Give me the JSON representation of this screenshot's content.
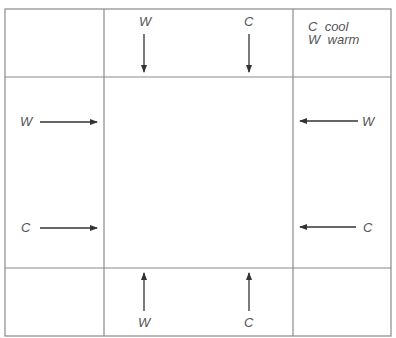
{
  "diagram": {
    "grid": {
      "outer": {
        "x1": 5,
        "y1": 9,
        "x2": 391,
        "y2": 336
      },
      "inner": {
        "x1": 104,
        "y1": 77,
        "x2": 293,
        "y2": 268
      },
      "line_color": "#8a8a8a"
    },
    "legend": {
      "entries": [
        {
          "symbol": "C",
          "meaning": "cool"
        },
        {
          "symbol": "W",
          "meaning": "warm"
        }
      ]
    },
    "arrows": [
      {
        "id": "top-left",
        "label": "W",
        "direction": "down",
        "label_x": 139,
        "label_y": 15
      },
      {
        "id": "top-right",
        "label": "C",
        "direction": "down",
        "label_x": 244,
        "label_y": 15
      },
      {
        "id": "left-top",
        "label": "W",
        "direction": "right",
        "label_x": 20,
        "label_y": 115
      },
      {
        "id": "left-bottom",
        "label": "C",
        "direction": "right",
        "label_x": 21,
        "label_y": 221
      },
      {
        "id": "right-top",
        "label": "W",
        "direction": "left",
        "label_x": 362,
        "label_y": 115
      },
      {
        "id": "right-bottom",
        "label": "C",
        "direction": "left",
        "label_x": 363,
        "label_y": 221
      },
      {
        "id": "bottom-left",
        "label": "W",
        "direction": "up",
        "label_x": 138,
        "label_y": 316
      },
      {
        "id": "bottom-right",
        "label": "C",
        "direction": "up",
        "label_x": 244,
        "label_y": 316
      }
    ]
  }
}
